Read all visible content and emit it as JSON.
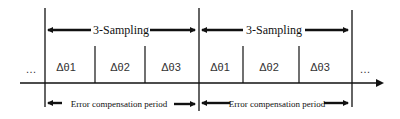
{
  "diagram": {
    "sampling_label": "3-Sampling",
    "sampling_groups": [
      {
        "label": "3-Sampling",
        "increments": [
          "Δθ1",
          "Δθ2",
          "Δθ3"
        ]
      },
      {
        "label": "3-Sampling",
        "increments": [
          "Δθ1",
          "Δθ2",
          "Δθ3"
        ]
      }
    ],
    "compensation_label": "Error compensation period",
    "compensation_periods": [
      {
        "label": "Error compensation period"
      },
      {
        "label": "Error compensation period"
      }
    ],
    "ellipsis_left": "…",
    "ellipsis_right": "…",
    "colors": {
      "line": "#111111",
      "text": "#111111",
      "background": "#ffffff"
    }
  }
}
